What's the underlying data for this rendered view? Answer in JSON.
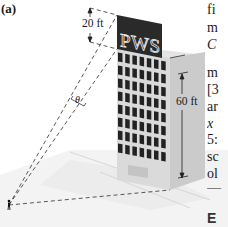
{
  "figure": {
    "panel_label": "(a)",
    "billboard_text": "PWS",
    "dimension_billboard": "20 ft",
    "dimension_building": "60 ft",
    "angle_symbol": "θ",
    "colors": {
      "billboard": "#2a2a2a",
      "window": "#232323",
      "building_front": "#d8d8d8",
      "building_side": "#c9c9c9",
      "building_top": "#e6e6e6",
      "ground": "#f1f1f1",
      "sight_lines": "#444444"
    }
  },
  "side_text": {
    "lines": [
      {
        "text": "fi",
        "style": "normal"
      },
      {
        "text": "m",
        "style": "normal"
      },
      {
        "text": "C",
        "style": "italic"
      },
      {
        "text": "",
        "style": "normal"
      },
      {
        "text": "m",
        "style": "normal"
      },
      {
        "text": "[3",
        "style": "normal"
      },
      {
        "text": "ar",
        "style": "normal"
      },
      {
        "text": "x",
        "style": "italic"
      },
      {
        "text": "5:",
        "style": "normal"
      },
      {
        "text": "sc",
        "style": "normal"
      },
      {
        "text": "ol",
        "style": "normal"
      },
      {
        "text": "—",
        "style": "normal"
      }
    ],
    "heading": "E"
  }
}
